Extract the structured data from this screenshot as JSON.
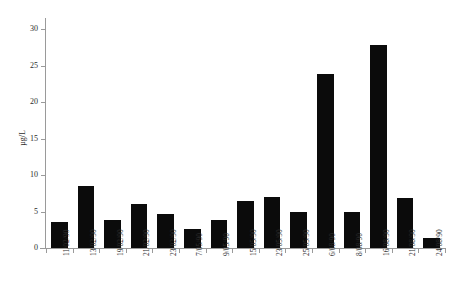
{
  "chart_data": {
    "type": "bar",
    "title": "",
    "subtitle": "",
    "xlabel": "",
    "ylabel": "µg/L",
    "ylim": [
      0,
      30
    ],
    "yticks": [
      0,
      5,
      10,
      15,
      20,
      25,
      30
    ],
    "ytick_labels": [
      "0",
      "5",
      "10",
      "15",
      "20",
      "25",
      "30"
    ],
    "grid": false,
    "legend": null,
    "bar_color": "#0b0b0b",
    "axis_color": "#9a9a9a",
    "categories": [
      "11/02/90",
      "13/02/90",
      "19/02/90",
      "21/02/90",
      "23/02/90",
      "7/05/90",
      "9/05/90",
      "15/05/90",
      "23/05/90",
      "25/05/90",
      "6/08/90",
      "8/08/90",
      "16/08/90",
      "21/08/90",
      "24/08/90"
    ],
    "values": [
      3.6,
      8.5,
      3.9,
      6.0,
      4.7,
      2.6,
      3.9,
      6.5,
      7.0,
      4.9,
      23.8,
      4.9,
      27.8,
      6.9,
      1.4
    ]
  }
}
